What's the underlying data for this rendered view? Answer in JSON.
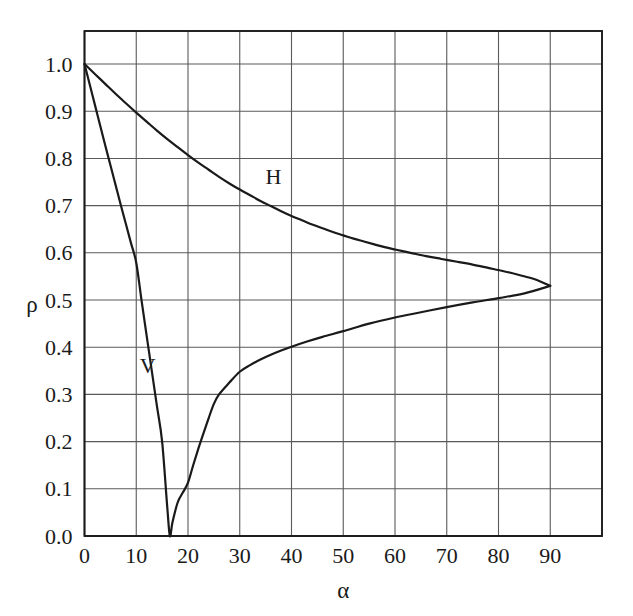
{
  "chart_data": {
    "type": "line",
    "title": "",
    "subtitle": "",
    "xlabel": "α",
    "ylabel": "ρ",
    "xlim": [
      0,
      100
    ],
    "ylim": [
      0.0,
      1.07
    ],
    "grid": true,
    "legend_position": "inline-annotations",
    "x_ticks": [
      0,
      10,
      20,
      30,
      40,
      50,
      60,
      70,
      80,
      90
    ],
    "x_tick_labels": [
      "0",
      "10",
      "20",
      "30",
      "40",
      "50",
      "60",
      "70",
      "80",
      "90"
    ],
    "y_ticks": [
      0.0,
      0.1,
      0.2,
      0.3,
      0.4,
      0.5,
      0.6,
      0.7,
      0.8,
      0.9,
      1.0
    ],
    "y_tick_labels": [
      "0.0",
      "0.1",
      "0.2",
      "0.3",
      "0.4",
      "0.5",
      "0.6",
      "0.7",
      "0.8",
      "0.9",
      "1.0"
    ],
    "line_color": "#1a1a1a",
    "grid_color": "#5a5a5a",
    "frame_color": "#1a1a1a",
    "background_color": "#ffffff",
    "annotations": [
      {
        "text": "H",
        "x": 36.5,
        "y": 0.745,
        "name": "curve-label-h"
      },
      {
        "text": "V",
        "x": 12.2,
        "y": 0.345,
        "name": "curve-label-v"
      }
    ],
    "series": [
      {
        "name": "H",
        "label": "H",
        "x": [
          0,
          2,
          4,
          6,
          8,
          10,
          12,
          14,
          16,
          18,
          20,
          22,
          24,
          26,
          28,
          30,
          32,
          34,
          36,
          38,
          40,
          42,
          44,
          46,
          48,
          50,
          52,
          54,
          56,
          58,
          60,
          63,
          66,
          69,
          72,
          75,
          78,
          81,
          84,
          87,
          90
        ],
        "values": [
          1.0,
          0.979,
          0.958,
          0.937,
          0.917,
          0.897,
          0.878,
          0.859,
          0.841,
          0.824,
          0.807,
          0.791,
          0.776,
          0.761,
          0.747,
          0.734,
          0.722,
          0.71,
          0.699,
          0.688,
          0.678,
          0.669,
          0.66,
          0.652,
          0.644,
          0.637,
          0.63,
          0.624,
          0.618,
          0.612,
          0.607,
          0.6,
          0.593,
          0.587,
          0.581,
          0.575,
          0.568,
          0.561,
          0.553,
          0.544,
          0.53
        ]
      },
      {
        "name": "V",
        "label": "V",
        "x": [
          0,
          1,
          2,
          3,
          4,
          5,
          6,
          7,
          8,
          9,
          10,
          11,
          12,
          13,
          14,
          15,
          16,
          16.5,
          17,
          18,
          19,
          20,
          21,
          22,
          23,
          24,
          25,
          26,
          28,
          30,
          32,
          34,
          36,
          38,
          40,
          43,
          46,
          50,
          55,
          60,
          65,
          70,
          75,
          80,
          85,
          90
        ],
        "values": [
          1.0,
          0.957,
          0.914,
          0.871,
          0.828,
          0.786,
          0.744,
          0.702,
          0.661,
          0.62,
          0.579,
          0.501,
          0.425,
          0.35,
          0.275,
          0.2,
          0.06,
          0.0,
          0.029,
          0.071,
          0.092,
          0.113,
          0.15,
          0.185,
          0.218,
          0.25,
          0.28,
          0.3,
          0.325,
          0.348,
          0.362,
          0.374,
          0.384,
          0.393,
          0.401,
          0.412,
          0.422,
          0.434,
          0.45,
          0.463,
          0.474,
          0.485,
          0.495,
          0.504,
          0.514,
          0.53
        ]
      }
    ]
  },
  "figure": {
    "alt": "Fresnel reflection coefficient rho versus incidence angle alpha for horizontal (H) and vertical (V) polarization"
  }
}
